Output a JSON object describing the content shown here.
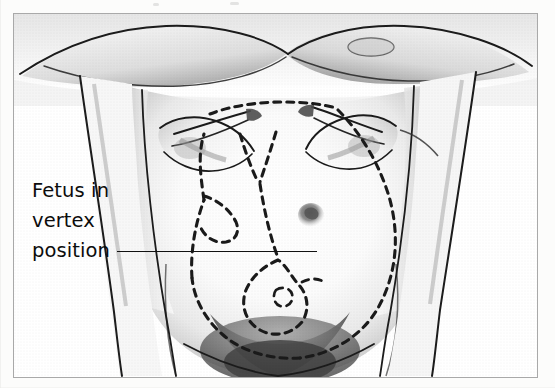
{
  "figure": {
    "type": "medical-illustration",
    "style": "grayscale halftone pencil drawing",
    "frame": {
      "border_color": "#a9a9a9",
      "background_color": "#ffffff",
      "x": 13,
      "y": 13,
      "width": 525,
      "height": 365
    }
  },
  "annotation": {
    "lines": [
      "Fetus in",
      "vertex",
      "position"
    ],
    "line1": "Fetus in",
    "line2": "vertex",
    "line3": "position",
    "full_text": "Fetus in vertex position",
    "text_color": "#0c0c0c",
    "leader_line": {
      "from_x": 103,
      "to_x": 303,
      "y": 237,
      "color": "#121212"
    }
  },
  "illustration_elements": {
    "torso": "pregnant abdomen seen from above, breasts at top, thighs at bottom",
    "hands": "two hands with fingers pressing down on upper abdomen",
    "navel": "umbilicus shaded at center of abdomen",
    "fetal_outline": "dashed line tracing fetus in vertex (head-down) position",
    "dash_color": "#1a1a1a",
    "shading_color": "#777777"
  },
  "colors": {
    "page_background": "#fbfbfa",
    "frame_border": "#a9a9a9",
    "ink": "#121212",
    "skin_light": "#fdfdfd",
    "skin_shadow": "#8d8d8d",
    "dark_shadow": "#4a4a4a"
  }
}
